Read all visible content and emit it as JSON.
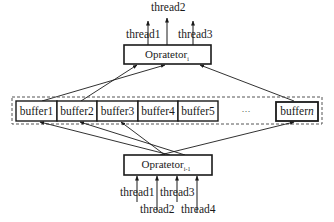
{
  "diagram": {
    "type": "pipeline-buffer-diagram",
    "operator_top": {
      "name": "Opratetor",
      "subscript": "i"
    },
    "operator_bottom": {
      "name": "Opratetor",
      "subscript": "i-1"
    },
    "top_threads": [
      "thread1",
      "thread2",
      "thread3"
    ],
    "bottom_threads": [
      "thread1",
      "thread2",
      "thread3",
      "thread4"
    ],
    "buffers": [
      "buffer1",
      "buffer2",
      "buffer3",
      "buffer4",
      "buffer5"
    ],
    "ellipsis": "···",
    "buffer_last": {
      "prefix": "buffer",
      "suffix": "n"
    },
    "edges": [
      {
        "from": "Opratetor_i-1",
        "to": "buffer1"
      },
      {
        "from": "Opratetor_i-1",
        "to": "buffer2"
      },
      {
        "from": "Opratetor_i-1",
        "to": "buffer3"
      },
      {
        "from": "Opratetor_i-1",
        "to": "buffern"
      },
      {
        "from": "buffer1",
        "to": "Opratetor_i"
      },
      {
        "from": "buffer2",
        "to": "Opratetor_i"
      },
      {
        "from": "buffern",
        "to": "Opratetor_i"
      },
      {
        "from": "thread1",
        "to": "Opratetor_i-1"
      },
      {
        "from": "thread2",
        "to": "Opratetor_i-1"
      },
      {
        "from": "thread3",
        "to": "Opratetor_i-1"
      },
      {
        "from": "thread4",
        "to": "Opratetor_i-1"
      },
      {
        "from": "Opratetor_i",
        "to": "thread1"
      },
      {
        "from": "Opratetor_i",
        "to": "thread2"
      },
      {
        "from": "Opratetor_i",
        "to": "thread3"
      }
    ]
  }
}
